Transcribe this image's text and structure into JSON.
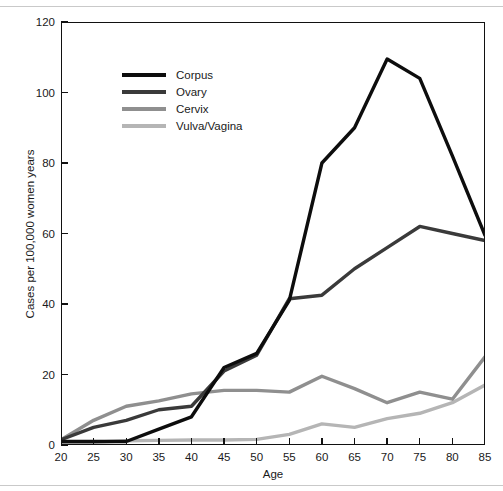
{
  "chart_data": {
    "type": "line",
    "title": "",
    "xlabel": "Age",
    "ylabel": "Cases per 100,000 women years",
    "x": [
      20,
      25,
      30,
      35,
      40,
      45,
      50,
      55,
      60,
      65,
      70,
      75,
      80,
      85
    ],
    "xlim": [
      20,
      85
    ],
    "ylim": [
      0,
      120
    ],
    "xticks": [
      "20",
      "25",
      "30",
      "35",
      "40",
      "45",
      "50",
      "55",
      "60",
      "65",
      "70",
      "75",
      "80",
      "85"
    ],
    "yticks": [
      "0",
      "20",
      "40",
      "60",
      "80",
      "100",
      "120"
    ],
    "grid": false,
    "legend_position": "upper-left",
    "series": [
      {
        "name": "Corpus",
        "color": "#0d0d0d",
        "values": [
          1,
          1,
          1,
          4.5,
          8,
          22,
          26,
          41,
          80,
          90,
          109.5,
          104,
          82,
          59.5
        ]
      },
      {
        "name": "Ovary",
        "color": "#3a3a3a",
        "values": [
          1.5,
          5,
          7,
          10,
          11,
          21,
          25.5,
          41.5,
          42.5,
          50,
          56,
          62,
          60,
          58
        ]
      },
      {
        "name": "Cervix",
        "color": "#8f8f8f",
        "values": [
          1.5,
          7,
          11,
          12.5,
          14.5,
          15.5,
          15.5,
          15,
          19.5,
          16,
          12,
          15,
          13,
          25
        ]
      },
      {
        "name": "Vulva/Vagina",
        "color": "#b5b5b5",
        "values": [
          0.5,
          0.8,
          1.2,
          1.3,
          1.4,
          1.4,
          1.6,
          3,
          6,
          5,
          7.5,
          9,
          12,
          17
        ]
      }
    ]
  },
  "axes": {
    "xlabel": "Age",
    "ylabel": "Cases per 100,000 women years"
  },
  "legend": {
    "items": [
      {
        "label": "Corpus"
      },
      {
        "label": "Ovary"
      },
      {
        "label": "Cervix"
      },
      {
        "label": "Vulva/Vagina"
      }
    ]
  }
}
